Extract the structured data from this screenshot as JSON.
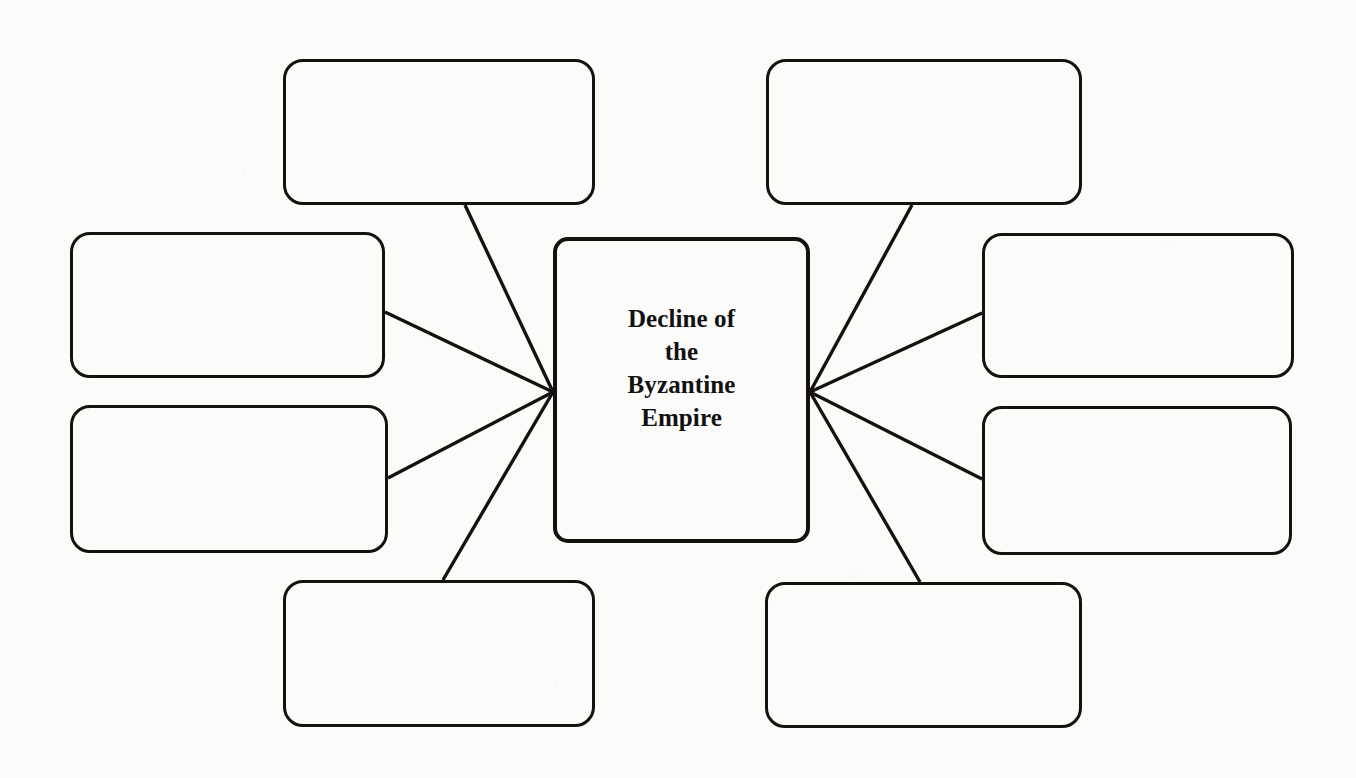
{
  "worksheet": {
    "title": "Decline of the Byzantine Empire",
    "type": "concept-web-graphic-organizer",
    "background_color": "#fbfbf9",
    "ink_color": "#14110f",
    "center": {
      "label": "Decline of\nthe\nByzantine\nEmpire",
      "lines": [
        "Decline of",
        "the",
        "Byzantine",
        "Empire"
      ],
      "x": 553,
      "y": 237,
      "width": 257,
      "height": 306,
      "stroke_width": 4,
      "corner_radius": 15
    },
    "hub_points": [
      {
        "name": "left-hub",
        "x": 553,
        "y": 392
      },
      {
        "name": "right-hub",
        "x": 810,
        "y": 392
      }
    ],
    "blank_boxes": [
      {
        "id": "top-left",
        "label": "",
        "x": 283,
        "y": 59,
        "width": 312,
        "height": 146,
        "connects_from": "edge-bottom",
        "anchor_x": 465,
        "anchor_y": 205,
        "hub": "left-hub"
      },
      {
        "id": "top-right",
        "label": "",
        "x": 766,
        "y": 59,
        "width": 316,
        "height": 146,
        "connects_from": "edge-bottom",
        "anchor_x": 912,
        "anchor_y": 205,
        "hub": "right-hub"
      },
      {
        "id": "middle-left",
        "label": "",
        "x": 70,
        "y": 232,
        "width": 315,
        "height": 146,
        "connects_from": "edge-right",
        "anchor_x": 385,
        "anchor_y": 312,
        "hub": "left-hub"
      },
      {
        "id": "middle-right",
        "label": "",
        "x": 982,
        "y": 233,
        "width": 312,
        "height": 145,
        "connects_from": "edge-left",
        "anchor_x": 982,
        "anchor_y": 313,
        "hub": "right-hub"
      },
      {
        "id": "lower-left",
        "label": "",
        "x": 70,
        "y": 405,
        "width": 318,
        "height": 148,
        "connects_from": "edge-right",
        "anchor_x": 388,
        "anchor_y": 478,
        "hub": "left-hub"
      },
      {
        "id": "lower-right",
        "label": "",
        "x": 982,
        "y": 406,
        "width": 310,
        "height": 149,
        "connects_from": "edge-left",
        "anchor_x": 982,
        "anchor_y": 479,
        "hub": "right-hub"
      },
      {
        "id": "bottom-left",
        "label": "",
        "x": 283,
        "y": 580,
        "width": 312,
        "height": 147,
        "connects_from": "edge-top",
        "anchor_x": 443,
        "anchor_y": 580,
        "hub": "left-hub"
      },
      {
        "id": "bottom-right",
        "label": "",
        "x": 765,
        "y": 582,
        "width": 317,
        "height": 146,
        "connects_from": "edge-top",
        "anchor_x": 920,
        "anchor_y": 582,
        "hub": "right-hub"
      }
    ]
  }
}
